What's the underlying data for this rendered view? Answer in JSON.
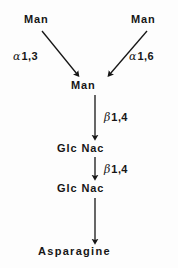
{
  "figure": {
    "background_color": "#fdfdfd",
    "ink_color": "#161616"
  },
  "nodes": [
    {
      "id": "man-left",
      "label": "Man",
      "x": 24,
      "y": 13
    },
    {
      "id": "man-right",
      "label": "Man",
      "x": 131,
      "y": 13
    },
    {
      "id": "man-center",
      "label": "Man",
      "x": 71,
      "y": 79
    },
    {
      "id": "glcnac-1",
      "label": "Glc Nac",
      "x": 57,
      "y": 142
    },
    {
      "id": "glcnac-2",
      "label": "Glc Nac",
      "x": 57,
      "y": 182
    },
    {
      "id": "asparagine",
      "label": "Asparagine",
      "x": 38,
      "y": 245
    }
  ],
  "bonds": [
    {
      "id": "alpha-1-3",
      "greek": "α",
      "linkage": "1,3",
      "from": "man-left",
      "to": "man-center"
    },
    {
      "id": "alpha-1-6",
      "greek": "α",
      "linkage": "1,6",
      "from": "man-right",
      "to": "man-center"
    },
    {
      "id": "beta-1-4-a",
      "greek": "β",
      "linkage": "1,4",
      "from": "man-center",
      "to": "glcnac-1"
    },
    {
      "id": "beta-1-4-b",
      "greek": "β",
      "linkage": "1,4",
      "from": "glcnac-1",
      "to": "glcnac-2"
    }
  ],
  "arrows": [
    {
      "id": "arrow-man-left-to-center",
      "x1": 42,
      "y1": 31,
      "x2": 78,
      "y2": 75,
      "type": "diagonal"
    },
    {
      "id": "arrow-man-right-to-center",
      "x1": 147,
      "y1": 31,
      "x2": 108,
      "y2": 75,
      "type": "diagonal"
    },
    {
      "id": "arrow-center-to-glcnac1",
      "x1": 95,
      "y1": 95,
      "x2": 95,
      "y2": 138,
      "type": "vertical"
    },
    {
      "id": "arrow-glcnac1-to-glcnac2",
      "x1": 95,
      "y1": 156,
      "x2": 95,
      "y2": 178,
      "type": "vertical"
    },
    {
      "id": "arrow-glcnac2-to-asparagine",
      "x1": 95,
      "y1": 198,
      "x2": 95,
      "y2": 241,
      "type": "vertical"
    }
  ]
}
